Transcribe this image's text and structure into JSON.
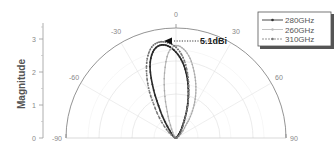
{
  "chart_data": {
    "type": "polar",
    "title": "",
    "ylabel": "Magnitude",
    "radial_ticks": [
      "0",
      "1",
      "2",
      "3"
    ],
    "radial_range": [
      0,
      3.35
    ],
    "angle_ticks": [
      "-90",
      "-60",
      "-30",
      "0",
      "30",
      "60",
      "90"
    ],
    "angle_range_deg": [
      -90,
      90
    ],
    "grid": true,
    "legend_position": "top-right",
    "annotation": {
      "text": "5.1dBi",
      "at_angle_deg": -3,
      "at_magnitude": 2.85
    },
    "series": [
      {
        "name": "280GHz",
        "style": "solid-dark-dots",
        "color": "#333333",
        "angles_deg": [
          -90,
          -60,
          -40,
          -30,
          -25,
          -20,
          -15,
          -10,
          -5,
          0,
          5,
          10,
          15,
          20,
          25,
          30,
          40,
          60,
          90
        ],
        "values": [
          0,
          0.05,
          0.3,
          0.95,
          1.6,
          2.3,
          2.7,
          2.85,
          2.8,
          2.6,
          2.3,
          1.9,
          1.45,
          1.0,
          0.6,
          0.35,
          0.1,
          0.02,
          0
        ]
      },
      {
        "name": "260GHz",
        "style": "light-dots",
        "color": "#aaaaaa",
        "angles_deg": [
          -90,
          -60,
          -30,
          -20,
          -15,
          -10,
          -5,
          0,
          5,
          10,
          15,
          20,
          25,
          30,
          35,
          40,
          60,
          90
        ],
        "values": [
          0,
          0.02,
          0.2,
          0.7,
          1.3,
          2.0,
          2.6,
          2.8,
          2.7,
          2.45,
          2.1,
          1.75,
          1.4,
          1.05,
          0.7,
          0.4,
          0.05,
          0
        ]
      },
      {
        "name": "310GHz",
        "style": "dashed-dots",
        "color": "#777777",
        "angles_deg": [
          -90,
          -60,
          -45,
          -35,
          -30,
          -25,
          -20,
          -15,
          -10,
          -5,
          0,
          5,
          10,
          15,
          20,
          30,
          60,
          90
        ],
        "values": [
          0,
          0.1,
          0.5,
          1.1,
          1.6,
          2.1,
          2.55,
          2.85,
          2.95,
          2.9,
          2.75,
          2.45,
          2.0,
          1.5,
          1.05,
          0.4,
          0.03,
          0
        ]
      }
    ]
  },
  "legend": {
    "items": [
      {
        "label": "280GHz"
      },
      {
        "label": "260GHz"
      },
      {
        "label": "310GHz"
      }
    ]
  },
  "labels": {
    "ylabel": "Magnitude",
    "annotation": "5.1dBi",
    "radial": [
      "0",
      "1",
      "2",
      "3"
    ],
    "angles": {
      "m90": "-90",
      "m60": "-60",
      "m30": "-30",
      "z": "0",
      "p30": "30",
      "p60": "60",
      "p90": "90"
    }
  }
}
